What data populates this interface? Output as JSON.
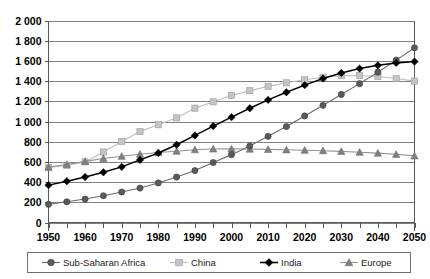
{
  "chart_data": {
    "type": "line",
    "title": "",
    "xlabel": "",
    "ylabel": "",
    "x": [
      1950,
      1955,
      1960,
      1965,
      1970,
      1975,
      1980,
      1985,
      1990,
      1995,
      2000,
      2005,
      2010,
      2015,
      2020,
      2025,
      2030,
      2035,
      2040,
      2045,
      2050
    ],
    "xlim": [
      1950,
      2050
    ],
    "ylim": [
      0,
      2000
    ],
    "y_tick_values": [
      0,
      200,
      400,
      600,
      800,
      1000,
      1200,
      1400,
      1600,
      1800,
      2000
    ],
    "y_tick_labels": [
      "0",
      "200",
      "400",
      "600",
      "800",
      "1 000",
      "1 200",
      "1 400",
      "1 600",
      "1 800",
      "2 000"
    ],
    "x_tick_labels": [
      "1950",
      "1960",
      "1970",
      "1980",
      "1990",
      "2000",
      "2010",
      "2020",
      "2030",
      "2040",
      "2050"
    ],
    "x_tick_values": [
      1950,
      1960,
      1970,
      1980,
      1990,
      2000,
      2010,
      2020,
      2030,
      2040,
      2050
    ],
    "x_minor_ticks": [
      1955,
      1965,
      1975,
      1985,
      1995,
      2005,
      2015,
      2025,
      2035,
      2045
    ],
    "grid": true,
    "grid_axis": "y",
    "legend_position": "bottom",
    "series": [
      {
        "name": "Sub-Saharan Africa",
        "marker": "circle",
        "color": "#5a5a5a",
        "line_color": "#6b6b6b",
        "values": [
          180,
          205,
          232,
          265,
          302,
          341,
          392,
          450,
          514,
          594,
          672,
          757,
          853,
          950,
          1055,
          1160,
          1268,
          1375,
          1488,
          1608,
          1730
        ]
      },
      {
        "name": "China",
        "marker": "square",
        "color": "#c4c4c4",
        "line_color": "#bdbdbd",
        "values": [
          545,
          565,
          600,
          698,
          803,
          900,
          968,
          1036,
          1132,
          1195,
          1258,
          1305,
          1348,
          1383,
          1413,
          1438,
          1453,
          1455,
          1445,
          1425,
          1400
        ]
      },
      {
        "name": "India",
        "marker": "diamond",
        "color": "#000000",
        "line_color": "#000000",
        "values": [
          370,
          409,
          450,
          497,
          551,
          620,
          688,
          770,
          862,
          955,
          1043,
          1131,
          1214,
          1289,
          1360,
          1426,
          1480,
          1524,
          1556,
          1580,
          1593
        ]
      },
      {
        "name": "Europe",
        "marker": "triangle",
        "color": "#808080",
        "line_color": "#949494",
        "values": [
          548,
          575,
          605,
          634,
          656,
          676,
          693,
          706,
          721,
          728,
          729,
          727,
          724,
          720,
          716,
          711,
          704,
          696,
          687,
          675,
          660
        ]
      }
    ]
  },
  "legend": {
    "items": [
      {
        "label": "Sub-Saharan Africa"
      },
      {
        "label": "China"
      },
      {
        "label": "India"
      },
      {
        "label": "Europe"
      }
    ]
  }
}
